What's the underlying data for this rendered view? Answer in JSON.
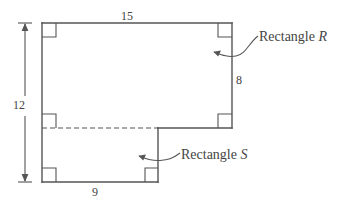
{
  "figure": {
    "type": "geometry-diagram",
    "stroke_color": "#555555",
    "text_color": "#444444",
    "background_color": "#ffffff"
  },
  "dimensions": {
    "top_width": "15",
    "right_height": "8",
    "left_height": "12",
    "bottom_width": "9"
  },
  "callouts": {
    "rectangle_r": {
      "prefix": "Rectangle ",
      "name": "R"
    },
    "rectangle_s": {
      "prefix": "Rectangle ",
      "name": "S"
    }
  },
  "markers": {
    "right_angle_count": 6,
    "dashed_divider": true
  }
}
